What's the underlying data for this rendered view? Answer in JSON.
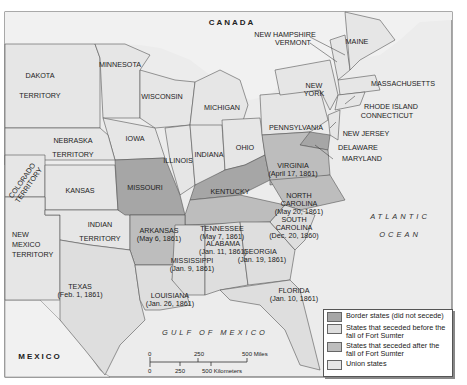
{
  "map": {
    "regions": {
      "canada": "CANADA",
      "mexico": "MEXICO",
      "gulf": "GULF OF MEXICO",
      "atlantic_line1": "ATLANTIC",
      "atlantic_line2": "OCEAN"
    },
    "states": {
      "dakota1": "DAKOTA",
      "dakota2": "TERRITORY",
      "minnesota": "MINNESOTA",
      "wisconsin": "WISCONSIN",
      "michigan": "MICHIGAN",
      "iowa": "IOWA",
      "nebraska1": "NEBRASKA",
      "nebraska2": "TERRITORY",
      "colorado1": "COLORADO",
      "colorado2": "TERRITORY",
      "kansas": "KANSAS",
      "missouri": "MISSOURI",
      "illinois": "ILLINOIS",
      "indiana": "INDIANA",
      "ohio": "OHIO",
      "kentucky": "KENTUCKY",
      "pennsylvania": "PENNSYLVANIA",
      "new_york1": "NEW",
      "new_york2": "YORK",
      "new_hampshire": "NEW HAMPSHIRE",
      "vermont": "VERMONT",
      "maine": "MAINE",
      "massachusetts": "MASSACHUSETTS",
      "rhode_island": "RHODE ISLAND",
      "connecticut": "CONNECTICUT",
      "new_jersey": "NEW JERSEY",
      "delaware": "DELAWARE",
      "maryland": "MARYLAND",
      "virginia": "VIRGINIA",
      "virginia_date": "(April 17, 1861)",
      "north_carolina1": "NORTH",
      "north_carolina2": "CAROLINA",
      "north_carolina_date": "(May 20, 1861)",
      "south_carolina1": "SOUTH",
      "south_carolina2": "CAROLINA",
      "south_carolina_date": "(Dec. 20, 1860)",
      "tennessee": "TENNESSEE",
      "tennessee_date": "(May 7, 1861)",
      "arkansas": "ARKANSAS",
      "arkansas_date": "(May 6, 1861)",
      "indian1": "INDIAN",
      "indian2": "TERRITORY",
      "new_mexico1": "NEW",
      "new_mexico2": "MEXICO",
      "new_mexico3": "TERRITORY",
      "texas": "TEXAS",
      "texas_date": "(Feb. 1, 1861)",
      "louisiana": "LOUISIANA",
      "louisiana_date": "(Jan. 26, 1861)",
      "mississippi": "MISSISSIPPI",
      "mississippi_date": "(Jan. 9, 1861)",
      "alabama": "ALABAMA",
      "alabama_date": "(Jan. 11, 1861)",
      "georgia": "GEORGIA",
      "georgia_date": "(Jan. 19, 1861)",
      "florida": "FLORIDA",
      "florida_date": "(Jan. 10, 1861)"
    },
    "scale": {
      "miles_0": "0",
      "miles_250": "250",
      "miles_500": "500 Miles",
      "km_0": "0",
      "km_250": "250",
      "km_500": "500 Kilometers"
    },
    "legend": {
      "items": [
        {
          "label": "Border states (did not secede)",
          "color": "#a6a6a6"
        },
        {
          "label": "States that seceded before the fall of Fort Sumter",
          "color": "#dedede"
        },
        {
          "label": "States that seceded after the fall of Fort Sumter",
          "color": "#bdbdbd"
        },
        {
          "label": "Union states",
          "color": "#e6e6e6"
        }
      ]
    }
  }
}
